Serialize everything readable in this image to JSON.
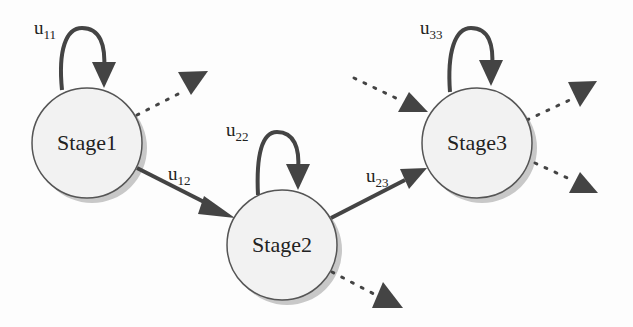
{
  "diagram": {
    "type": "state-transition",
    "colors": {
      "node_fill": "#f2f2f2",
      "node_stroke": "#555555",
      "edge": "#444444",
      "shadow": "#bdbdbd"
    },
    "nodes": [
      {
        "id": "stage1",
        "label": "Stage1"
      },
      {
        "id": "stage2",
        "label": "Stage2"
      },
      {
        "id": "stage3",
        "label": "Stage3"
      }
    ],
    "edges": [
      {
        "from": "stage1",
        "to": "stage1",
        "label_base": "u",
        "label_sub": "11",
        "style": "solid"
      },
      {
        "from": "stage1",
        "to": "stage2",
        "label_base": "u",
        "label_sub": "12",
        "style": "solid"
      },
      {
        "from": "stage2",
        "to": "stage2",
        "label_base": "u",
        "label_sub": "22",
        "style": "solid"
      },
      {
        "from": "stage2",
        "to": "stage3",
        "label_base": "u",
        "label_sub": "23",
        "style": "solid"
      },
      {
        "from": "stage3",
        "to": "stage3",
        "label_base": "u",
        "label_sub": "33",
        "style": "solid"
      },
      {
        "from": "stage1",
        "to": "(out)",
        "style": "dotted"
      },
      {
        "from": "stage2",
        "to": "(out)",
        "style": "dotted"
      },
      {
        "from": "(in)",
        "to": "stage3",
        "style": "dotted"
      },
      {
        "from": "stage3",
        "to": "(out)",
        "style": "dotted"
      },
      {
        "from": "stage3",
        "to": "(out)",
        "style": "dotted"
      }
    ]
  }
}
